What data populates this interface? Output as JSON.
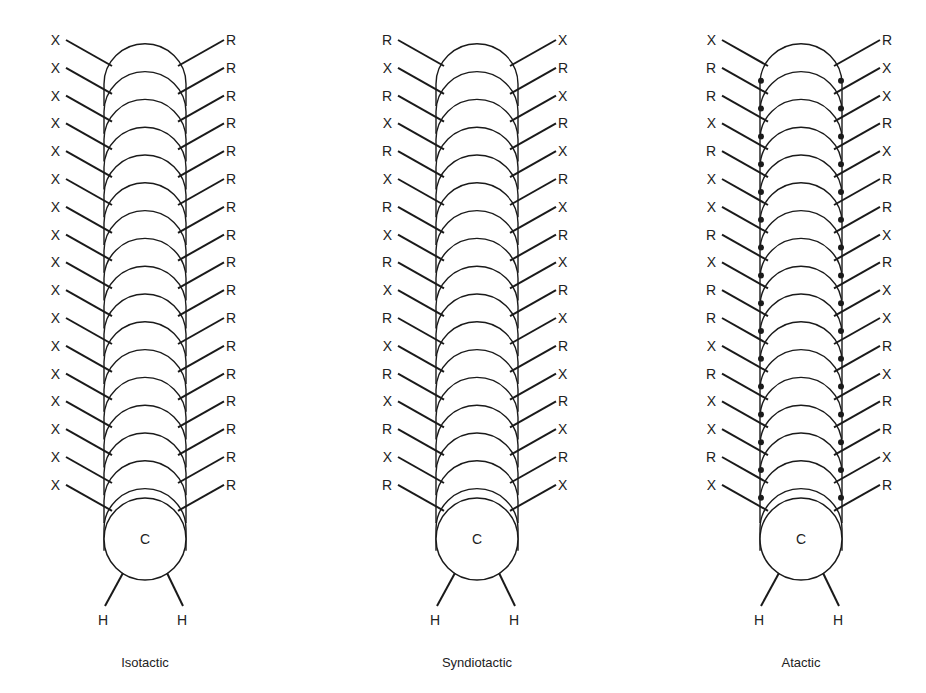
{
  "figure": {
    "panels": [
      {
        "caption": "Isotactic",
        "center_x": 145,
        "left_labels": [
          "X",
          "X",
          "X",
          "X",
          "X",
          "X",
          "X",
          "X",
          "X",
          "X",
          "X",
          "X",
          "X",
          "X",
          "X",
          "X",
          "X"
        ],
        "right_labels": [
          "R",
          "R",
          "R",
          "R",
          "R",
          "R",
          "R",
          "R",
          "R",
          "R",
          "R",
          "R",
          "R",
          "R",
          "R",
          "R",
          "R"
        ],
        "carbon_label": "C",
        "hydrogen_labels": [
          "H",
          "H"
        ],
        "filled_joints": false
      },
      {
        "caption": "Syndiotactic",
        "center_x": 477,
        "left_labels": [
          "R",
          "X",
          "R",
          "X",
          "R",
          "X",
          "R",
          "X",
          "R",
          "X",
          "R",
          "X",
          "R",
          "X",
          "R",
          "X",
          "R"
        ],
        "right_labels": [
          "X",
          "R",
          "X",
          "R",
          "X",
          "R",
          "X",
          "R",
          "X",
          "R",
          "X",
          "R",
          "X",
          "R",
          "X",
          "R",
          "X"
        ],
        "carbon_label": "C",
        "hydrogen_labels": [
          "H",
          "H"
        ],
        "filled_joints": false
      },
      {
        "caption": "Atactic",
        "center_x": 801,
        "left_labels": [
          "X",
          "R",
          "R",
          "X",
          "R",
          "X",
          "X",
          "R",
          "X",
          "R",
          "R",
          "X",
          "R",
          "X",
          "X",
          "R",
          "X"
        ],
        "right_labels": [
          "R",
          "X",
          "X",
          "R",
          "X",
          "R",
          "R",
          "X",
          "R",
          "X",
          "X",
          "R",
          "X",
          "R",
          "R",
          "X",
          "R"
        ],
        "carbon_label": "C",
        "hydrogen_labels": [
          "H",
          "H"
        ],
        "filled_joints": true
      }
    ]
  }
}
